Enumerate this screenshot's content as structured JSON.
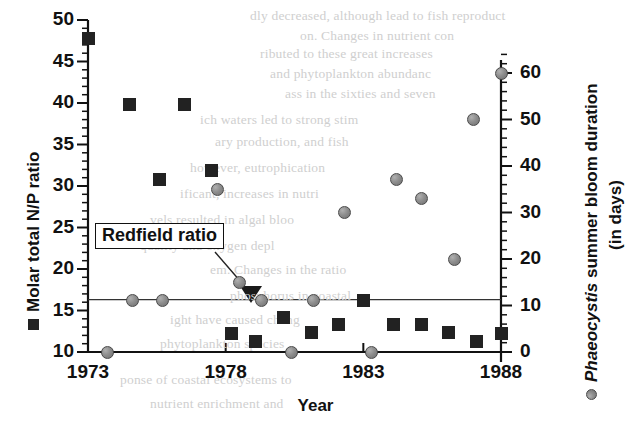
{
  "chart_data": {
    "type": "scatter",
    "title": "",
    "xlabel": "Year",
    "ylabel_left": "Molar total N/P ratio",
    "ylabel_right_line1": "Phaeocystis summer bloom duration",
    "ylabel_right_line2": "(in days)",
    "ylabel_right_italic_part": "Phaeocystis",
    "xlim": [
      1973,
      1988
    ],
    "xticks": [
      1973,
      1978,
      1983,
      1988
    ],
    "xticklabels": [
      "1973",
      "1978",
      "1983",
      "1988"
    ],
    "ylim_left": [
      10,
      50
    ],
    "yticks_left": [
      10,
      15,
      20,
      25,
      30,
      35,
      40,
      45,
      50
    ],
    "yticklabels_left": [
      "10",
      "15",
      "20",
      "25",
      "30",
      "35",
      "40",
      "45",
      "50"
    ],
    "yminor_left_step": 1,
    "ylim_right": [
      0,
      64
    ],
    "yticks_right": [
      0,
      10,
      20,
      30,
      40,
      50,
      60
    ],
    "yticklabels_right": [
      "0",
      "10",
      "20",
      "30",
      "40",
      "50",
      "60"
    ],
    "yminor_right_step": 2,
    "grid": false,
    "legend": "marker-prefixed axis labels",
    "annotations": [
      {
        "text": "Redfield ratio",
        "kind": "boxed-label-with-arrow",
        "points_to_value": 16.3,
        "description": "horizontal reference line at molar N/P = 16"
      }
    ],
    "reference_lines": [
      {
        "name": "Redfield ratio",
        "axis": "left",
        "value": 16.3
      }
    ],
    "series": [
      {
        "name": "Molar total N/P ratio",
        "marker": "filled-square",
        "color": "#222222",
        "axis": "left",
        "points": [
          {
            "x": 1973.0,
            "y": 47.8
          },
          {
            "x": 1974.5,
            "y": 39.8
          },
          {
            "x": 1975.6,
            "y": 30.8
          },
          {
            "x": 1976.5,
            "y": 39.8
          },
          {
            "x": 1977.5,
            "y": 31.9
          },
          {
            "x": 1978.2,
            "y": 12.2
          },
          {
            "x": 1979.1,
            "y": 11.3
          },
          {
            "x": 1980.1,
            "y": 14.2
          },
          {
            "x": 1981.1,
            "y": 12.3
          },
          {
            "x": 1982.1,
            "y": 13.3
          },
          {
            "x": 1983.0,
            "y": 16.2
          },
          {
            "x": 1984.1,
            "y": 13.3
          },
          {
            "x": 1985.1,
            "y": 13.3
          },
          {
            "x": 1986.1,
            "y": 12.3
          },
          {
            "x": 1987.1,
            "y": 11.3
          },
          {
            "x": 1988.0,
            "y": 12.2
          }
        ]
      },
      {
        "name": "Phaeocystis summer bloom duration (in days)",
        "marker": "filled-circle",
        "color": "#8e8e8e",
        "axis": "right",
        "points": [
          {
            "x": 1973.7,
            "y": 0
          },
          {
            "x": 1974.6,
            "y": 11
          },
          {
            "x": 1975.7,
            "y": 11
          },
          {
            "x": 1977.7,
            "y": 35
          },
          {
            "x": 1978.5,
            "y": 15
          },
          {
            "x": 1979.3,
            "y": 11
          },
          {
            "x": 1980.4,
            "y": 0
          },
          {
            "x": 1981.2,
            "y": 11
          },
          {
            "x": 1982.3,
            "y": 30
          },
          {
            "x": 1983.3,
            "y": 0
          },
          {
            "x": 1984.2,
            "y": 37
          },
          {
            "x": 1985.1,
            "y": 33
          },
          {
            "x": 1986.3,
            "y": 20
          },
          {
            "x": 1987.0,
            "y": 50
          },
          {
            "x": 1988.0,
            "y": 60
          }
        ]
      }
    ]
  },
  "background_text": {
    "note": "faint underlying printed page text visible behind the figure",
    "lines": [
      {
        "t": "dly decreased, although lead to fish reproduct",
        "x": 250,
        "y": 8
      },
      {
        "t": "on.   Changes in nutrient con",
        "x": 300,
        "y": 28
      },
      {
        "t": "ributed to these great increases",
        "x": 260,
        "y": 46
      },
      {
        "t": "and phytoplankton abundanc",
        "x": 270,
        "y": 66
      },
      {
        "t": "ass in the sixties and seven",
        "x": 285,
        "y": 86
      },
      {
        "t": "ich waters led to strong stim",
        "x": 200,
        "y": 112
      },
      {
        "t": "ary production, and fish",
        "x": 215,
        "y": 134
      },
      {
        "t": "however, eutrophication",
        "x": 190,
        "y": 160
      },
      {
        "t": "ificant, increases in nutri",
        "x": 180,
        "y": 186
      },
      {
        "t": "vels resulted in algal bloo",
        "x": 150,
        "y": 212
      },
      {
        "t": "quality and oxygen depl",
        "x": 140,
        "y": 238
      },
      {
        "t": "em. Changes in the ratio",
        "x": 210,
        "y": 262
      },
      {
        "t": "phosphorus in coastal",
        "x": 230,
        "y": 288
      },
      {
        "t": "ight have caused chang",
        "x": 170,
        "y": 312
      },
      {
        "t": "phytoplankton species",
        "x": 160,
        "y": 336
      },
      {
        "t": "ponse of coastal ecosystems to",
        "x": 120,
        "y": 372
      },
      {
        "t": "nutrient enrichment and",
        "x": 150,
        "y": 396
      }
    ]
  }
}
